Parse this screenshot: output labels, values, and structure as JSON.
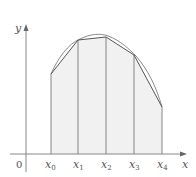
{
  "figure": {
    "axis_labels": {
      "x": "x",
      "y": "y",
      "origin": "0"
    },
    "ticks": [
      {
        "base": "x",
        "sub": "0",
        "px": 51
      },
      {
        "base": "x",
        "sub": "1",
        "px": 78
      },
      {
        "base": "x",
        "sub": "2",
        "px": 106
      },
      {
        "base": "x",
        "sub": "3",
        "px": 134
      },
      {
        "base": "x",
        "sub": "4",
        "px": 162
      }
    ],
    "curve_points": [
      [
        51,
        74
      ],
      [
        78,
        40
      ],
      [
        106,
        37
      ],
      [
        134,
        55
      ],
      [
        162,
        107
      ]
    ],
    "colors": {
      "axis": "#7a7a7a",
      "curve": "#8a8a8a",
      "polyline": "#555555",
      "fill": "#f1f1f1",
      "verticals": "#6a6a6a",
      "text": "#555555"
    }
  }
}
